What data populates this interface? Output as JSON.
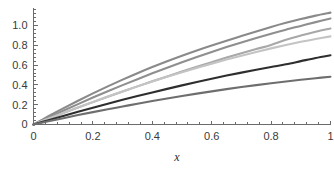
{
  "chart_data": {
    "type": "line",
    "title": "",
    "subtitle": "",
    "xlabel": "x",
    "ylabel": "",
    "xlim": [
      0,
      1
    ],
    "ylim": [
      0,
      1.18
    ],
    "grid": false,
    "legend": "none",
    "x_ticks": [
      0,
      0.2,
      0.4,
      0.6,
      0.8,
      1
    ],
    "x_tick_labels": [
      "0",
      "0.2",
      "0.4",
      "0.6",
      "0.8",
      "1"
    ],
    "x_minor_tick_count": 4,
    "y_ticks": [
      0,
      0.2,
      0.4,
      0.6,
      0.8,
      1.0
    ],
    "y_tick_labels": [
      "0",
      "0.2",
      "0.4",
      "0.6",
      "0.8",
      "1.0"
    ],
    "y_minor_tick_count": 4,
    "x": [
      0,
      0.05,
      0.1,
      0.15,
      0.2,
      0.25,
      0.3,
      0.35,
      0.4,
      0.45,
      0.5,
      0.55,
      0.6,
      0.65,
      0.7,
      0.75,
      0.8,
      0.85,
      0.9,
      0.95,
      1
    ],
    "series": [
      {
        "name": "curve-1",
        "color": "#8a8a8a",
        "final_value": 1.13,
        "values": [
          0,
          0.083,
          0.163,
          0.24,
          0.314,
          0.385,
          0.453,
          0.518,
          0.58,
          0.639,
          0.695,
          0.748,
          0.798,
          0.846,
          0.893,
          0.94,
          0.985,
          1.027,
          1.065,
          1.1,
          1.13
        ]
      },
      {
        "name": "curve-2",
        "color": "#8f8f8f",
        "final_value": 1.07,
        "values": [
          0,
          0.07,
          0.139,
          0.206,
          0.272,
          0.336,
          0.398,
          0.458,
          0.517,
          0.574,
          0.629,
          0.682,
          0.733,
          0.782,
          0.829,
          0.874,
          0.917,
          0.958,
          0.996,
          1.034,
          1.07
        ]
      },
      {
        "name": "curve-3",
        "color": "#a8a8a8",
        "final_value": 0.97,
        "values": [
          0,
          0.058,
          0.115,
          0.171,
          0.226,
          0.28,
          0.333,
          0.385,
          0.436,
          0.486,
          0.535,
          0.583,
          0.63,
          0.676,
          0.72,
          0.762,
          0.803,
          0.855,
          0.898,
          0.937,
          0.97
        ]
      },
      {
        "name": "curve-4",
        "color": "#c4c4c4",
        "final_value": 0.89,
        "values": [
          0,
          0.059,
          0.117,
          0.173,
          0.228,
          0.282,
          0.334,
          0.385,
          0.434,
          0.482,
          0.528,
          0.572,
          0.615,
          0.656,
          0.695,
          0.733,
          0.769,
          0.803,
          0.835,
          0.864,
          0.89
        ]
      },
      {
        "name": "curve-5",
        "color": "#2e2e2e",
        "final_value": 0.7,
        "values": [
          0,
          0.044,
          0.087,
          0.129,
          0.17,
          0.21,
          0.249,
          0.287,
          0.324,
          0.36,
          0.395,
          0.429,
          0.462,
          0.494,
          0.524,
          0.553,
          0.581,
          0.608,
          0.64,
          0.672,
          0.7
        ]
      },
      {
        "name": "curve-6",
        "color": "#6e6e6e",
        "final_value": 0.48,
        "values": [
          0,
          0.032,
          0.064,
          0.095,
          0.125,
          0.154,
          0.182,
          0.21,
          0.237,
          0.263,
          0.288,
          0.312,
          0.335,
          0.357,
          0.378,
          0.398,
          0.417,
          0.435,
          0.452,
          0.468,
          0.483
        ]
      }
    ]
  },
  "axes": {
    "x_axis_title": "x"
  },
  "colors": {
    "axis": "#6b6b6b",
    "tick_text": "#3a3a3a",
    "background": "#ffffff"
  }
}
